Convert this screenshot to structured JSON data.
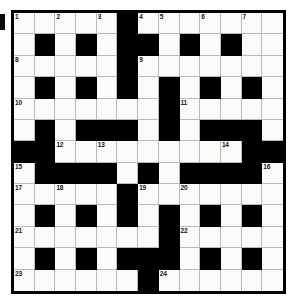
{
  "puzzle": {
    "type": "crossword-grid",
    "rows": 13,
    "columns": 13,
    "colors": {
      "block": "#000000",
      "cell": "#fbfbfa",
      "gridline": "#b9b9b7",
      "border": "#000000",
      "number_text": "#111111",
      "page_background": "#ffffff"
    },
    "layout": [
      "WWWWWBWWWWWWW",
      "WBWBWBBWBWBWW",
      "WWWWWBWWWWWWW",
      "WBWBWBWBWBWBW",
      "WWWWWWWBWWWWW",
      "WBWBBBWBWBBBW",
      "BBWWWWWWWWWBB",
      "WBBBBWBWBBBBW",
      "WWWWWBWWWWWWW",
      "WBWBWBWBWBWBW",
      "WWWWWWWBWWWWW",
      "WBWBWBBBWBWBW",
      "WWWWWWBWWWWWW"
    ],
    "numbers": [
      {
        "n": "1",
        "row": 1,
        "col": 1
      },
      {
        "n": "2",
        "row": 1,
        "col": 3
      },
      {
        "n": "3",
        "row": 1,
        "col": 5
      },
      {
        "n": "4",
        "row": 1,
        "col": 7
      },
      {
        "n": "5",
        "row": 1,
        "col": 8
      },
      {
        "n": "6",
        "row": 1,
        "col": 10
      },
      {
        "n": "7",
        "row": 1,
        "col": 12
      },
      {
        "n": "8",
        "row": 3,
        "col": 1
      },
      {
        "n": "9",
        "row": 3,
        "col": 7
      },
      {
        "n": "10",
        "row": 5,
        "col": 1
      },
      {
        "n": "11",
        "row": 5,
        "col": 9
      },
      {
        "n": "12",
        "row": 7,
        "col": 3
      },
      {
        "n": "13",
        "row": 7,
        "col": 5
      },
      {
        "n": "14",
        "row": 7,
        "col": 11
      },
      {
        "n": "15",
        "row": 8,
        "col": 1
      },
      {
        "n": "16",
        "row": 8,
        "col": 13
      },
      {
        "n": "17",
        "row": 9,
        "col": 1
      },
      {
        "n": "18",
        "row": 9,
        "col": 3
      },
      {
        "n": "19",
        "row": 9,
        "col": 7
      },
      {
        "n": "20",
        "row": 9,
        "col": 9
      },
      {
        "n": "21",
        "row": 11,
        "col": 1
      },
      {
        "n": "22",
        "row": 11,
        "col": 9
      },
      {
        "n": "23",
        "row": 13,
        "col": 1
      },
      {
        "n": "24",
        "row": 13,
        "col": 8
      }
    ],
    "entries": []
  }
}
